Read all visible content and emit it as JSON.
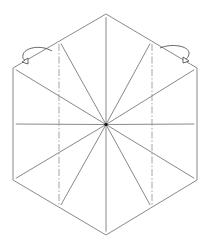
{
  "diagram": {
    "type": "origami-step",
    "shape": "hexagon",
    "radial_crease_count": 12,
    "fold_lines": [
      {
        "name": "left-valley-fold",
        "style": "dash-dot"
      },
      {
        "name": "right-valley-fold",
        "style": "dash-dot"
      }
    ],
    "arrows": [
      {
        "name": "fold-arrow-left",
        "direction": "fold-behind"
      },
      {
        "name": "fold-arrow-right",
        "direction": "fold-behind"
      }
    ],
    "colors": {
      "line": "#8a8a8a",
      "center": "#111111",
      "background": "#ffffff"
    }
  }
}
